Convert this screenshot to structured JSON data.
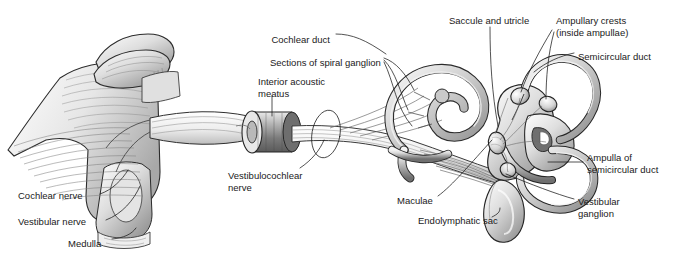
{
  "figure": {
    "style": "grayscale pen-and-ink anatomical illustration",
    "background_color": "#ffffff",
    "ink_color": "#1a1a1a"
  },
  "labels": [
    {
      "id": "cochlear-duct",
      "text": "Cochlear duct",
      "x": 330,
      "y": 34,
      "align": "right"
    },
    {
      "id": "saccule-and-utricle",
      "text": "Saccule and utricle",
      "x": 449,
      "y": 15,
      "align": "left"
    },
    {
      "id": "ampullary-crests",
      "text": "Ampullary crests\n(inside ampullae)",
      "x": 556,
      "y": 15,
      "align": "left"
    },
    {
      "id": "semicircular-duct",
      "text": "Semicircular duct",
      "x": 578,
      "y": 51,
      "align": "left"
    },
    {
      "id": "sections-spiral-ganglion",
      "text": "Sections of spiral ganglion",
      "x": 270,
      "y": 57,
      "align": "left"
    },
    {
      "id": "interior-acoustic-meatus",
      "text": "Interior acoustic\nmeatus",
      "x": 258,
      "y": 76,
      "align": "left"
    },
    {
      "id": "vestibulocochlear-nerve",
      "text": "Vestibulocochlear\nnerve",
      "x": 228,
      "y": 170,
      "align": "left"
    },
    {
      "id": "ampulla-of-semicircular-duct",
      "text": "Ampulla of\nsemicircular duct",
      "x": 587,
      "y": 152,
      "align": "left"
    },
    {
      "id": "maculae",
      "text": "Maculae",
      "x": 397,
      "y": 195,
      "align": "left"
    },
    {
      "id": "endolymphatic-sac",
      "text": "Endolymphatic sac",
      "x": 418,
      "y": 215,
      "align": "left"
    },
    {
      "id": "vestibular-ganglion",
      "text": "Vestibular\nganglion",
      "x": 578,
      "y": 196,
      "align": "left"
    },
    {
      "id": "cochlear-nerve",
      "text": "Cochlear nerve",
      "x": 18,
      "y": 190,
      "align": "left"
    },
    {
      "id": "vestibular-nerve",
      "text": "Vestibular nerve",
      "x": 18,
      "y": 216,
      "align": "left"
    },
    {
      "id": "medulla",
      "text": "Medulla",
      "x": 68,
      "y": 238,
      "align": "left"
    }
  ],
  "structures": [
    {
      "id": "medulla-brainstem",
      "name": "Medulla / brainstem",
      "region": "left"
    },
    {
      "id": "cerebellum-flocculus",
      "name": "Cerebellar fold",
      "region": "upper-left"
    },
    {
      "id": "nerve-trunk",
      "name": "Vestibulocochlear nerve trunk",
      "region": "center"
    },
    {
      "id": "internal-acoustic-meatus-cylinder",
      "name": "Internal acoustic meatus",
      "region": "center-left"
    },
    {
      "id": "cochlea-spiral",
      "name": "Cochlea (spiral, 2.5 turns)",
      "region": "center-right"
    },
    {
      "id": "vestibule-saccule-utricle",
      "name": "Saccule and utricle",
      "region": "right"
    },
    {
      "id": "semicircular-canals",
      "name": "Three semicircular ducts",
      "region": "right"
    },
    {
      "id": "endolymphatic-sac-body",
      "name": "Endolymphatic sac",
      "region": "lower-right"
    },
    {
      "id": "vestibular-ganglion-body",
      "name": "Vestibular ganglion",
      "region": "right"
    }
  ]
}
